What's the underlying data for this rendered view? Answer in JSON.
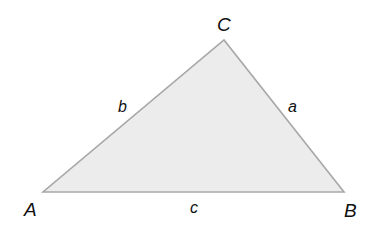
{
  "diagram": {
    "type": "triangle",
    "fill_color": "#ececec",
    "stroke_color": "#a8a8a8",
    "vertices": [
      {
        "label": "A",
        "x": 43,
        "y": 192
      },
      {
        "label": "B",
        "x": 344,
        "y": 192
      },
      {
        "label": "C",
        "x": 224,
        "y": 40
      }
    ],
    "vertex_labels": {
      "A": "A",
      "B": "B",
      "C": "C"
    },
    "side_labels": {
      "a": "a",
      "b": "b",
      "c": "c"
    }
  }
}
